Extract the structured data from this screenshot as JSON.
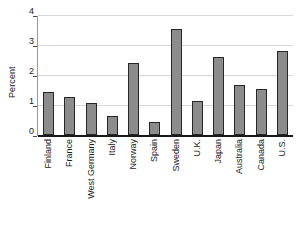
{
  "chart_data": {
    "type": "bar",
    "title": "",
    "subtitle": "",
    "xlabel": "",
    "ylabel": "Percent",
    "ylim": [
      0,
      4
    ],
    "yticks": [
      0,
      1,
      2,
      3,
      4
    ],
    "ytick_labels": [
      "0",
      "1",
      "2",
      "3",
      "4"
    ],
    "grid": true,
    "grid_axis": "y",
    "legend": null,
    "legend_position": "none",
    "bar_color": "#8c8c8c",
    "bar_edge_color": "#262626",
    "axis_color": "#1a1a1a",
    "gridline_color": "#d8d8d8",
    "background_color": "#ffffff",
    "categories": [
      "Finland",
      "France",
      "West Germany",
      "Italy",
      "Norway",
      "Spain",
      "Sweden",
      "U.K.",
      "Japan",
      "Australia",
      "Canada",
      "U.S."
    ],
    "values": [
      1.45,
      1.28,
      1.08,
      0.62,
      2.4,
      0.42,
      3.55,
      1.12,
      2.6,
      1.67,
      1.55,
      2.8
    ],
    "annotations": []
  }
}
